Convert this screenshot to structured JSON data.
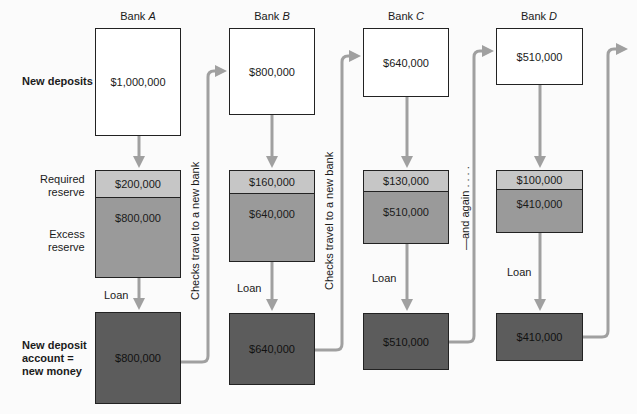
{
  "row_labels": {
    "new_deposits": "New deposits",
    "required_reserve": "Required\nreserve",
    "excess_reserve": "Excess\nreserve",
    "new_deposit_account": "New deposit\naccount =\nnew money"
  },
  "banks": [
    {
      "prefix": "Bank ",
      "letter": "A",
      "new_deposit": "$1,000,000",
      "required_reserve": "$200,000",
      "excess_reserve": "$800,000",
      "loan_label": "Loan",
      "new_money": "$800,000"
    },
    {
      "prefix": "Bank ",
      "letter": "B",
      "new_deposit": "$800,000",
      "required_reserve": "$160,000",
      "excess_reserve": "$640,000",
      "loan_label": "Loan",
      "new_money": "$640,000"
    },
    {
      "prefix": "Bank ",
      "letter": "C",
      "new_deposit": "$640,000",
      "required_reserve": "$130,000",
      "excess_reserve": "$510,000",
      "loan_label": "Loan",
      "new_money": "$510,000"
    },
    {
      "prefix": "Bank ",
      "letter": "D",
      "new_deposit": "$510,000",
      "required_reserve": "$100,000",
      "excess_reserve": "$410,000",
      "loan_label": "Loan",
      "new_money": "$410,000"
    }
  ],
  "connectors": {
    "checks_travel": "Checks travel to a new bank",
    "and_again": "—and again . . . ."
  },
  "colors": {
    "white_box": "#ffffff",
    "required_reserve": "#c6c6c6",
    "excess_reserve": "#9a9a9a",
    "new_money": "#5c5c5c",
    "arrow": "#a0a0a0"
  }
}
